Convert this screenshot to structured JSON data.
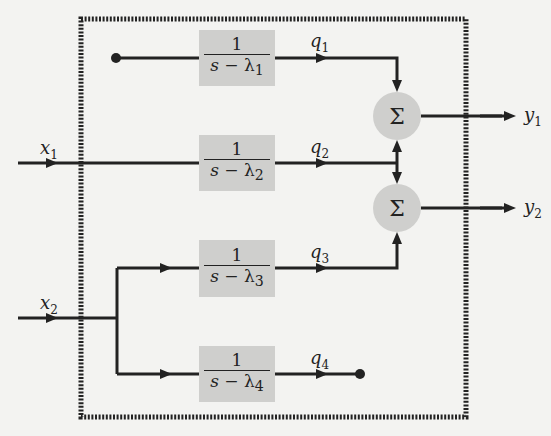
{
  "diagram": {
    "type": "block-diagram",
    "inputs": [
      {
        "id": "x1",
        "label": "x",
        "sub": "1"
      },
      {
        "id": "x2",
        "label": "x",
        "sub": "2"
      }
    ],
    "blocks": [
      {
        "id": "b1",
        "numerator": "1",
        "den_var": "s",
        "den_op": " − ",
        "den_sym": "λ",
        "den_sub": "1"
      },
      {
        "id": "b2",
        "numerator": "1",
        "den_var": "s",
        "den_op": " − ",
        "den_sym": "λ",
        "den_sub": "2"
      },
      {
        "id": "b3",
        "numerator": "1",
        "den_var": "s",
        "den_op": " − ",
        "den_sym": "λ",
        "den_sub": "3"
      },
      {
        "id": "b4",
        "numerator": "1",
        "den_var": "s",
        "den_op": " − ",
        "den_sym": "λ",
        "den_sub": "4"
      }
    ],
    "states": [
      {
        "id": "q1",
        "label": "q",
        "sub": "1"
      },
      {
        "id": "q2",
        "label": "q",
        "sub": "2"
      },
      {
        "id": "q3",
        "label": "q",
        "sub": "3"
      },
      {
        "id": "q4",
        "label": "q",
        "sub": "4"
      }
    ],
    "summers": [
      {
        "id": "sum1",
        "symbol": "Σ"
      },
      {
        "id": "sum2",
        "symbol": "Σ"
      }
    ],
    "outputs": [
      {
        "id": "y1",
        "label": "y",
        "sub": "1"
      },
      {
        "id": "y2",
        "label": "y",
        "sub": "2"
      }
    ],
    "connections": [
      "b1 input unconnected (dot)",
      "x1 -> b2",
      "x2 -> b3",
      "x2 -> b4",
      "q1 -> sum1",
      "q2 -> sum1",
      "q2 -> sum2",
      "q3 -> sum2",
      "q4 unconnected (dot)",
      "sum1 -> y1",
      "sum2 -> y2"
    ],
    "colors": {
      "background": "#f3f3f1",
      "block_fill": "#cfcfcd",
      "line": "#222222"
    }
  }
}
